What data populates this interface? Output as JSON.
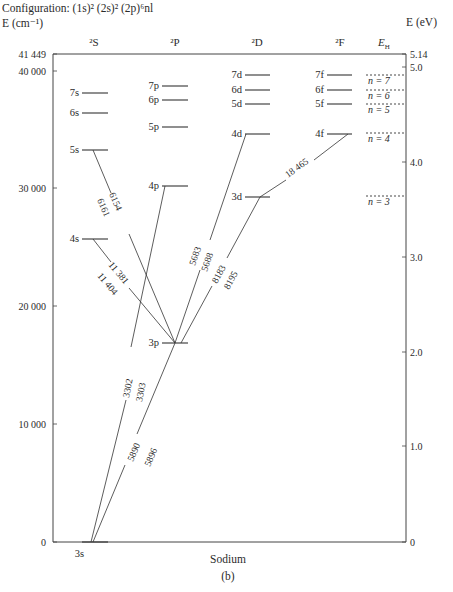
{
  "header": {
    "configuration": "Configuration: (1s)² (2s)² (2p)⁶nl",
    "left_axis_unit": "E (cm⁻¹)",
    "right_axis_unit": "E (eV)"
  },
  "columns": [
    {
      "label": "²S",
      "x": 94
    },
    {
      "label": "²P",
      "x": 175
    },
    {
      "label": "²D",
      "x": 257
    },
    {
      "label": "²F",
      "x": 340
    },
    {
      "label": "E_H",
      "x": 384
    }
  ],
  "left_ticks": [
    {
      "label": "41 449",
      "y": 54
    },
    {
      "label": "40 000",
      "y": 71
    },
    {
      "label": "30 000",
      "y": 188
    },
    {
      "label": "20 000",
      "y": 306
    },
    {
      "label": "10 000",
      "y": 424
    },
    {
      "label": "0",
      "y": 542
    }
  ],
  "right_ticks": [
    {
      "label": "5.14",
      "y": 54
    },
    {
      "label": "5.0",
      "y": 67
    },
    {
      "label": "4.0",
      "y": 162
    },
    {
      "label": "3.0",
      "y": 257
    },
    {
      "label": "2.0",
      "y": 352
    },
    {
      "label": "1.0",
      "y": 446
    },
    {
      "label": "0",
      "y": 542
    }
  ],
  "levels": {
    "S": [
      {
        "label": "3s",
        "y": 542
      },
      {
        "label": "4s",
        "y": 239
      },
      {
        "label": "5s",
        "y": 150
      },
      {
        "label": "6s",
        "y": 113
      },
      {
        "label": "7s",
        "y": 93
      }
    ],
    "P": [
      {
        "label": "3p",
        "y": 343
      },
      {
        "label": "4p",
        "y": 186
      },
      {
        "label": "5p",
        "y": 127
      },
      {
        "label": "6p",
        "y": 100
      },
      {
        "label": "7p",
        "y": 86
      }
    ],
    "D": [
      {
        "label": "3d",
        "y": 197
      },
      {
        "label": "4d",
        "y": 134
      },
      {
        "label": "5d",
        "y": 104
      },
      {
        "label": "6d",
        "y": 90
      },
      {
        "label": "7d",
        "y": 75
      }
    ],
    "F": [
      {
        "label": "4f",
        "y": 134
      },
      {
        "label": "5f",
        "y": 104
      },
      {
        "label": "6f",
        "y": 90
      },
      {
        "label": "7f",
        "y": 75
      }
    ],
    "H": [
      {
        "label": "n = 3",
        "y": 196
      },
      {
        "label": "n = 4",
        "y": 133
      },
      {
        "label": "n = 5",
        "y": 104
      },
      {
        "label": "n = 6",
        "y": 90
      },
      {
        "label": "n = 7",
        "y": 75
      }
    ]
  },
  "transitions": [
    {
      "from": "5s",
      "to": "3p",
      "wavelengths": [
        "6154",
        "6161"
      ]
    },
    {
      "from": "4s",
      "to": "3p",
      "wavelengths": [
        "11 381",
        "11 404"
      ]
    },
    {
      "from": "4p",
      "to": "3s",
      "wavelengths": [
        "3302",
        "3303"
      ]
    },
    {
      "from": "3p",
      "to": "3s",
      "wavelengths": [
        "5890",
        "5896"
      ]
    },
    {
      "from": "4d",
      "to": "3p",
      "wavelengths": [
        "5683",
        "5688"
      ]
    },
    {
      "from": "3d",
      "to": "3p",
      "wavelengths": [
        "8183",
        "8195"
      ]
    },
    {
      "from": "4f",
      "to": "3d",
      "wavelengths": [
        "18 465"
      ]
    }
  ],
  "footer": {
    "element": "Sodium",
    "panel": "(b)"
  },
  "chart_data": {
    "type": "energy-level-diagram",
    "title": "Configuration: (1s)² (2s)² (2p)⁶nl",
    "xlabel": "Sodium",
    "ylabel": "E (cm⁻¹)",
    "ylabel_right": "E (eV)",
    "ylim": [
      0,
      41449
    ],
    "ylim_right": [
      0,
      5.14
    ],
    "columns": [
      "²S",
      "²P",
      "²D",
      "²F",
      "E_H"
    ],
    "levels_cm1_approx": {
      "3s": 0,
      "4s": 25740,
      "5s": 33200,
      "6s": 36370,
      "7s": 38010,
      "3p": 16960,
      "4p": 30270,
      "5p": 35040,
      "6p": 37300,
      "7p": 38540,
      "3d": 29170,
      "4d": 34550,
      "5d": 37040,
      "6d": 38200,
      "7d": 39500,
      "4f": 34590,
      "5f": 37060,
      "6f": 38220,
      "7f": 39500
    },
    "hydrogen_levels": [
      "n = 3",
      "n = 4",
      "n = 5",
      "n = 6",
      "n = 7"
    ],
    "transitions_angstrom": [
      {
        "upper": "5s",
        "lower": "3p",
        "lines": [
          6154,
          6161
        ]
      },
      {
        "upper": "4s",
        "lower": "3p",
        "lines": [
          11381,
          11404
        ]
      },
      {
        "upper": "4p",
        "lower": "3s",
        "lines": [
          3302,
          3303
        ]
      },
      {
        "upper": "3p",
        "lower": "3s",
        "lines": [
          5890,
          5896
        ]
      },
      {
        "upper": "4d",
        "lower": "3p",
        "lines": [
          5683,
          5688
        ]
      },
      {
        "upper": "3d",
        "lower": "3p",
        "lines": [
          8183,
          8195
        ]
      },
      {
        "upper": "4f",
        "lower": "3d",
        "lines": [
          18465
        ]
      }
    ],
    "caption": "(b)"
  }
}
